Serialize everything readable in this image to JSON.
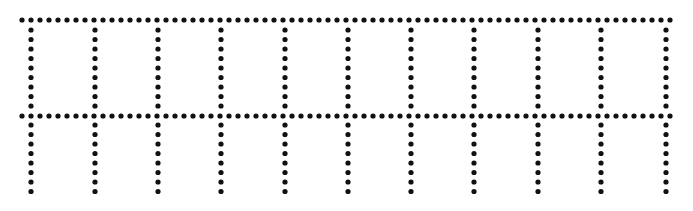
{
  "diagram": {
    "type": "dotted-grid",
    "dot_color": "#111111",
    "background": "#ffffff",
    "dot_radius": 2.6,
    "horizontal_lines": [
      {
        "y": 20,
        "x_start": 22,
        "x_end": 676,
        "spacing": 9
      },
      {
        "y": 116,
        "x_start": 22,
        "x_end": 676,
        "spacing": 9
      }
    ],
    "vertical_lines": {
      "x_positions": [
        31,
        95,
        158,
        221,
        285,
        348,
        411,
        474,
        538,
        601,
        666
      ],
      "y_start": 30,
      "y_end": 198,
      "spacing": 9.5
    },
    "rows": 2,
    "columns": 10
  }
}
